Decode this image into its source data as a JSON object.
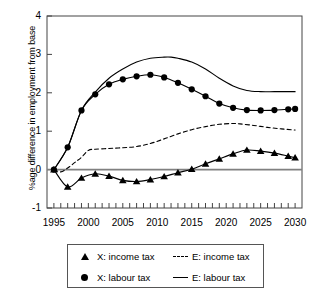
{
  "chart_data": {
    "type": "line",
    "title": "",
    "xlabel": "",
    "ylabel": "%age difference in employment from base",
    "xlim": [
      1994,
      2031
    ],
    "ylim": [
      -1,
      4
    ],
    "xticks": [
      1995,
      2000,
      2005,
      2010,
      2015,
      2020,
      2025,
      2030
    ],
    "xtick_labels": [
      "1995",
      "2000",
      "2005",
      "2010",
      "2015",
      "2020",
      "2025",
      "2030"
    ],
    "yticks": [
      -1,
      0,
      1,
      2,
      3,
      4
    ],
    "ytick_labels": [
      "-1",
      "0",
      "1",
      "2",
      "3",
      "4"
    ],
    "minor_xtick_interval": 1,
    "grid": false,
    "legend_position": "below-axes",
    "zero_line": true,
    "series": [
      {
        "name": "X: income tax",
        "style": "solid-with-markers",
        "marker": "triangle",
        "color": "#000000",
        "x": [
          1995,
          1997,
          1999,
          2001,
          2003,
          2005,
          2007,
          2009,
          2011,
          2013,
          2015,
          2017,
          2019,
          2021,
          2023,
          2025,
          2027,
          2029,
          2030
        ],
        "values": [
          0.0,
          -0.45,
          -0.22,
          -0.11,
          -0.17,
          -0.28,
          -0.31,
          -0.26,
          -0.18,
          -0.08,
          0.01,
          0.15,
          0.28,
          0.41,
          0.51,
          0.48,
          0.43,
          0.35,
          0.31
        ]
      },
      {
        "name": "X: labour tax",
        "style": "solid-with-markers",
        "marker": "circle",
        "color": "#000000",
        "x": [
          1995,
          1997,
          1999,
          2001,
          2003,
          2005,
          2007,
          2009,
          2011,
          2013,
          2015,
          2017,
          2019,
          2021,
          2023,
          2025,
          2027,
          2029,
          2030
        ],
        "values": [
          0.0,
          0.58,
          1.54,
          1.96,
          2.22,
          2.35,
          2.43,
          2.47,
          2.4,
          2.26,
          2.09,
          1.91,
          1.72,
          1.61,
          1.55,
          1.54,
          1.55,
          1.57,
          1.58
        ]
      },
      {
        "name": "E: income tax",
        "style": "dashed",
        "marker": "none",
        "color": "#000000",
        "x": [
          1995,
          1996,
          1997,
          1998,
          1999,
          2000,
          2001,
          2003,
          2005,
          2007,
          2009,
          2011,
          2013,
          2015,
          2017,
          2019,
          2021,
          2022,
          2024,
          2026,
          2028,
          2030
        ],
        "values": [
          0.0,
          -0.06,
          0.04,
          0.18,
          0.32,
          0.5,
          0.53,
          0.55,
          0.57,
          0.6,
          0.68,
          0.8,
          0.93,
          1.04,
          1.12,
          1.18,
          1.2,
          1.19,
          1.15,
          1.1,
          1.06,
          1.03
        ]
      },
      {
        "name": "E: labour tax",
        "style": "solid",
        "marker": "none",
        "color": "#000000",
        "x": [
          1995,
          1997,
          1999,
          2001,
          2003,
          2005,
          2007,
          2009,
          2011,
          2012,
          2013,
          2015,
          2017,
          2019,
          2021,
          2023,
          2025,
          2027,
          2029,
          2030
        ],
        "values": [
          0.0,
          0.58,
          1.54,
          2.02,
          2.38,
          2.62,
          2.8,
          2.9,
          2.93,
          2.93,
          2.9,
          2.8,
          2.62,
          2.38,
          2.18,
          2.06,
          2.03,
          2.03,
          2.03,
          2.03
        ]
      }
    ]
  },
  "legend": {
    "rows": [
      {
        "left": {
          "key": "triangle-marker-icon",
          "label": "X: income tax"
        },
        "right": {
          "key": "dashed-line-icon",
          "label": "E: income tax"
        }
      },
      {
        "left": {
          "key": "circle-marker-icon",
          "label": "X: labour tax"
        },
        "right": {
          "key": "solid-line-icon",
          "label": "E: labour tax"
        }
      }
    ]
  }
}
